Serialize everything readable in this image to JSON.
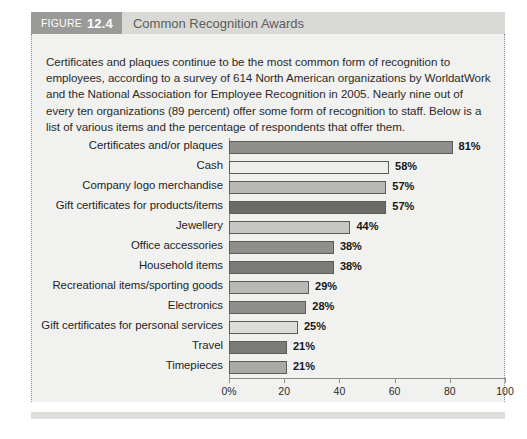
{
  "figure": {
    "badge_word": "FIGURE",
    "badge_number": "12.4",
    "title": "Common Recognition Awards",
    "intro": "Certificates and plaques continue to be the most common form of recognition to employees, according to a survey of 614 North American organizations by WorldatWork and the National Association for Employee Recognition in 2005. Nearly nine out of every ten organizations (89 percent) offer some form of recognition to staff. Below is a list of various items and the percentage of respondents that offer them."
  },
  "colors": {
    "header_strip": "#d9d9d6",
    "badge": "#9a9a99",
    "panel_background": "#f1f1ef",
    "axis": "#8d8d8c",
    "bar_outline": "#5b5b5a"
  },
  "chart_data": {
    "type": "bar",
    "orientation": "horizontal",
    "title": "Common Recognition Awards",
    "xlabel": "",
    "ylabel": "",
    "xlim": [
      0,
      100
    ],
    "grid": false,
    "legend": false,
    "xticks": [
      0,
      20,
      40,
      60,
      80,
      100
    ],
    "xtick_labels": [
      "0%",
      "20",
      "40",
      "60",
      "80",
      "100"
    ],
    "value_suffix": "%",
    "categories": [
      "Certificates and/or plaques",
      "Cash",
      "Company logo merchandise",
      "Gift certificates for products/items",
      "Jewellery",
      "Office accessories",
      "Household items",
      "Recreational items/sporting goods",
      "Electronics",
      "Gift certificates for personal services",
      "Travel",
      "Timepieces"
    ],
    "values": [
      81,
      58,
      57,
      57,
      44,
      38,
      38,
      29,
      28,
      25,
      21,
      21
    ],
    "value_labels": [
      "81%",
      "58%",
      "57%",
      "57%",
      "44%",
      "38%",
      "38%",
      "29%",
      "28%",
      "25%",
      "21%",
      "21%"
    ],
    "bar_colors": [
      "#8e8e8d",
      "#eeeeec",
      "#b8b8b6",
      "#6b6b6a",
      "#c6c6c4",
      "#8e8e8d",
      "#7b7b7a",
      "#b8b8b6",
      "#8e8e8d",
      "#dcdcda",
      "#7b7b7a",
      "#a9a9a7"
    ]
  }
}
